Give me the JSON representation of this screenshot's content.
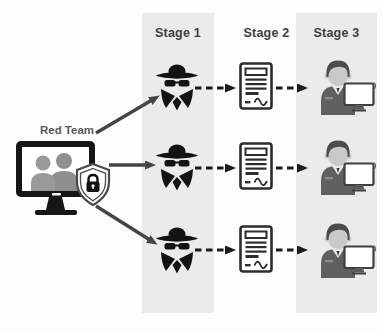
{
  "diagram": {
    "source": {
      "label": "Red Team",
      "icon": "team-monitor-with-shield-lock"
    },
    "stages": [
      {
        "label": "Stage 1",
        "icon": "spy-incognito-icon",
        "column_band": true
      },
      {
        "label": "Stage 2",
        "icon": "signed-document-icon",
        "column_band": false
      },
      {
        "label": "Stage 3",
        "icon": "analyst-at-computer-icon",
        "column_band": true
      }
    ],
    "rows": 3,
    "connections": {
      "source_to_stage1": "solid-arrow",
      "stage1_to_stage2": "dashed-arrow",
      "stage2_to_stage3": "dashed-arrow"
    },
    "colors": {
      "column_band": "#ebebeb",
      "ink_black": "#161616",
      "solid_arrow": "#454545",
      "dashed_arrow": "#1b1b1b",
      "stage_label_text": "#3f3f3f",
      "red_team_text": "#595959",
      "shield_outline": "#4a4a4a",
      "screen_people": "#8f8f8f",
      "analyst_hair": "#4c4c4c",
      "analyst_face": "#c9c9c9",
      "analyst_shirt": "#5f5f5f",
      "document_ink": "#2d2d2d"
    }
  }
}
